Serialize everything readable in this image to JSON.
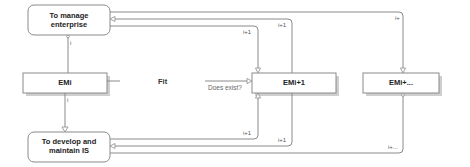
{
  "diagram": {
    "nodes": {
      "manage_enterprise": {
        "label_line1": "To manage",
        "label_line2": "enterprise",
        "shape": "rounded-rect"
      },
      "emi": {
        "label": "EMi",
        "shape": "rect-shadow"
      },
      "develop_is": {
        "label_line1": "To develop and",
        "label_line2": "maintain IS",
        "shape": "rounded-rect"
      },
      "emi_next": {
        "label": "EMi+1",
        "shape": "rect-shadow"
      },
      "emi_more": {
        "label": "EMi+...",
        "shape": "rect-shadow"
      }
    },
    "center_label": "Fit",
    "question_label": "Does exist?",
    "edge_labels": {
      "manage_to_emi": "i",
      "emi_to_develop": "i",
      "manage_loop_inner": "i+1",
      "manage_loop_outer": "i+1",
      "manage_loop_far": "i+",
      "develop_loop_inner": "i+1",
      "develop_loop_outer": "i+1",
      "develop_loop_far": "i+..."
    },
    "colors": {
      "line": "#8a8a8a",
      "shadow": "#cfcfcf",
      "text": "#222222"
    }
  }
}
